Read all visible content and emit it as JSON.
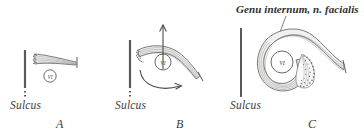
{
  "figure": {
    "title_label": "Genu internum, n. facialis",
    "nucleus_label": "VI",
    "panels": [
      {
        "letter": "A",
        "sulcus_label": "Sulcus",
        "nucleus_label": "VI",
        "description": "straight nerve bundle lateral to sulcus, nucleus VI below"
      },
      {
        "letter": "B",
        "sulcus_label": "Sulcus",
        "nucleus_label": "VI",
        "description": "nerve bundle curving over nucleus VI with migration arrows"
      },
      {
        "letter": "C",
        "sulcus_label": "Sulcus",
        "nucleus_label": "VI",
        "description": "nerve bundle looped completely around nucleus VI forming internal genu"
      }
    ],
    "colors": {
      "ink": "#3a3a3a",
      "line": "#555555",
      "fill": "#f2f1ee",
      "background": "#ffffff"
    }
  }
}
